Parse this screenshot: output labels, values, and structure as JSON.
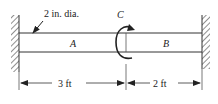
{
  "diagram": {
    "shaft_label": "2 in. dia.",
    "segment_a_label": "A",
    "segment_b_label": "B",
    "torque_label": "C",
    "dim_left": "3 ft",
    "dim_right": "2 ft"
  },
  "colors": {
    "line": "#333333",
    "background": "#ffffff"
  }
}
